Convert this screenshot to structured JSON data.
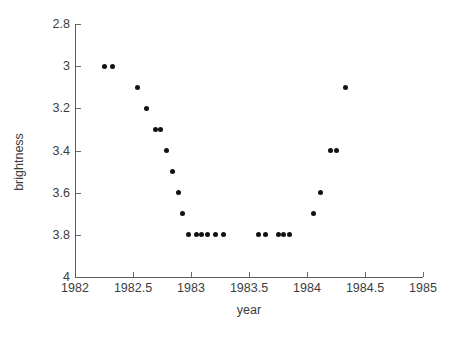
{
  "chart_data": {
    "type": "scatter",
    "title": "",
    "xlabel": "year",
    "ylabel": "brightness",
    "xlim": [
      1982,
      1985
    ],
    "ylim": [
      2.8,
      4.0
    ],
    "y_inverted": true,
    "grid": false,
    "legend": null,
    "xticks": [
      1982,
      1982.5,
      1983,
      1983.5,
      1984,
      1984.5,
      1985
    ],
    "xtick_labels": [
      "1982",
      "1982.5",
      "1983",
      "1983.5",
      "1984",
      "1984.5",
      "1985"
    ],
    "yticks": [
      2.8,
      3.0,
      3.2,
      3.4,
      3.6,
      3.8,
      4.0
    ],
    "ytick_labels": [
      "2.8",
      "3",
      "3.2",
      "3.4",
      "3.6",
      "3.8",
      "4"
    ],
    "series": [
      {
        "name": "brightness",
        "marker": "circle",
        "color": "#121212",
        "points": [
          {
            "x": 1982.25,
            "y": 3.0
          },
          {
            "x": 1982.32,
            "y": 3.0
          },
          {
            "x": 1982.54,
            "y": 3.1
          },
          {
            "x": 1982.62,
            "y": 3.2
          },
          {
            "x": 1982.69,
            "y": 3.3
          },
          {
            "x": 1982.74,
            "y": 3.3
          },
          {
            "x": 1982.79,
            "y": 3.4
          },
          {
            "x": 1982.84,
            "y": 3.5
          },
          {
            "x": 1982.89,
            "y": 3.6
          },
          {
            "x": 1982.93,
            "y": 3.7
          },
          {
            "x": 1982.98,
            "y": 3.8
          },
          {
            "x": 1983.05,
            "y": 3.8
          },
          {
            "x": 1983.09,
            "y": 3.8
          },
          {
            "x": 1983.14,
            "y": 3.8
          },
          {
            "x": 1983.21,
            "y": 3.8
          },
          {
            "x": 1983.28,
            "y": 3.8
          },
          {
            "x": 1983.58,
            "y": 3.8
          },
          {
            "x": 1983.64,
            "y": 3.8
          },
          {
            "x": 1983.75,
            "y": 3.8
          },
          {
            "x": 1983.8,
            "y": 3.8
          },
          {
            "x": 1983.85,
            "y": 3.8
          },
          {
            "x": 1984.06,
            "y": 3.7
          },
          {
            "x": 1984.12,
            "y": 3.6
          },
          {
            "x": 1984.2,
            "y": 3.4
          },
          {
            "x": 1984.25,
            "y": 3.4
          },
          {
            "x": 1984.33,
            "y": 3.1
          }
        ]
      }
    ]
  }
}
